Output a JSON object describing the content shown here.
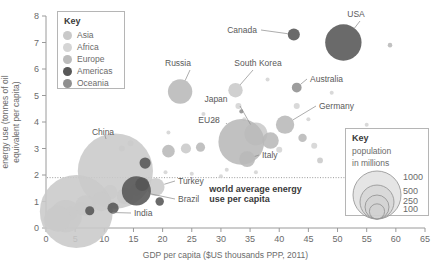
{
  "chart_data": {
    "type": "scatter",
    "title": "",
    "xlabel": "GDP per capita ($US thousands PPP, 2011)",
    "ylabel": "energy use (tonnes of oil equivalent per capita)",
    "xlim": [
      0,
      65
    ],
    "ylim": [
      0,
      8
    ],
    "xticks": [
      "0",
      "5",
      "10",
      "15",
      "20",
      "25",
      "30",
      "35",
      "40",
      "45",
      "50",
      "55",
      "60",
      "65"
    ],
    "yticks": [
      "0",
      "1",
      "2",
      "3",
      "4",
      "5",
      "6",
      "7",
      "8"
    ],
    "grid": false,
    "legend_position": "top-left",
    "bubble_size_meaning": "population in millions",
    "annotations": [
      {
        "name": "world-average-line",
        "text": "world average energy use per capita",
        "y_value": 1.9,
        "style": "dotted horizontal line across plot"
      }
    ],
    "series": [
      {
        "name": "Asia",
        "color": "#c9c9c9",
        "points": [
          {
            "label": "China",
            "x": 11.9,
            "y": 2.15,
            "population": 1360
          },
          {
            "label": "India",
            "x": 5.2,
            "y": 0.62,
            "population": 1280
          },
          {
            "label": "Japan",
            "x": 36.0,
            "y": 3.55,
            "population": 127
          },
          {
            "label": "South Korea",
            "x": 32.5,
            "y": 5.2,
            "population": 50
          },
          {
            "label": "Turkey",
            "x": 18.8,
            "y": 1.55,
            "population": 77
          },
          {
            "label": "",
            "x": 2.0,
            "y": 0.35,
            "population": 160
          },
          {
            "label": "",
            "x": 3.4,
            "y": 0.45,
            "population": 250
          },
          {
            "label": "",
            "x": 6.8,
            "y": 0.85,
            "population": 100
          },
          {
            "label": "",
            "x": 9.5,
            "y": 1.0,
            "population": 90
          },
          {
            "label": "",
            "x": 13.5,
            "y": 1.2,
            "population": 60
          },
          {
            "label": "",
            "x": 15.5,
            "y": 1.45,
            "population": 30
          },
          {
            "label": "",
            "x": 24.0,
            "y": 3.0,
            "population": 25
          },
          {
            "label": "",
            "x": 47.0,
            "y": 2.55,
            "population": 8
          }
        ]
      },
      {
        "name": "Africa",
        "color": "#d5d5d5",
        "points": [
          {
            "label": "",
            "x": 1.2,
            "y": 0.3,
            "population": 90
          },
          {
            "label": "",
            "x": 2.6,
            "y": 0.4,
            "population": 50
          },
          {
            "label": "",
            "x": 4.2,
            "y": 0.55,
            "population": 45
          },
          {
            "label": "",
            "x": 6.0,
            "y": 0.75,
            "population": 40
          },
          {
            "label": "",
            "x": 11.0,
            "y": 1.35,
            "population": 52
          }
        ]
      },
      {
        "name": "Europe",
        "color": "#b8b8b8",
        "points": [
          {
            "label": "EU28",
            "x": 33.5,
            "y": 3.25,
            "population": 505
          },
          {
            "label": "Germany",
            "x": 41.0,
            "y": 3.9,
            "population": 81
          },
          {
            "label": "Russia",
            "x": 23.0,
            "y": 5.15,
            "population": 143
          },
          {
            "label": "Italy",
            "x": 34.5,
            "y": 2.6,
            "population": 60
          },
          {
            "label": "",
            "x": 38.5,
            "y": 3.3,
            "population": 66
          },
          {
            "label": "",
            "x": 44.0,
            "y": 3.4,
            "population": 17
          },
          {
            "label": "",
            "x": 21.0,
            "y": 2.9,
            "population": 38
          },
          {
            "label": "",
            "x": 26.5,
            "y": 3.05,
            "population": 20
          },
          {
            "label": "",
            "x": 59.0,
            "y": 6.9,
            "population": 5
          }
        ]
      },
      {
        "name": "Americas",
        "color": "#555555",
        "points": [
          {
            "label": "USA",
            "x": 51.0,
            "y": 7.0,
            "population": 318
          },
          {
            "label": "Canada",
            "x": 42.5,
            "y": 7.3,
            "population": 35
          },
          {
            "label": "Brazil",
            "x": 15.5,
            "y": 1.4,
            "population": 203
          },
          {
            "label": "",
            "x": 17.0,
            "y": 2.45,
            "population": 30
          },
          {
            "label": "",
            "x": 16.5,
            "y": 1.65,
            "population": 45
          },
          {
            "label": "",
            "x": 19.5,
            "y": 1.0,
            "population": 17
          },
          {
            "label": "",
            "x": 11.5,
            "y": 0.75,
            "population": 30
          },
          {
            "label": "",
            "x": 7.5,
            "y": 0.65,
            "population": 20
          }
        ]
      },
      {
        "name": "Oceania",
        "color": "#8f8f8f",
        "points": [
          {
            "label": "Australia",
            "x": 43.0,
            "y": 5.3,
            "population": 23
          },
          {
            "label": "",
            "x": 33.5,
            "y": 4.4,
            "population": 4
          }
        ]
      }
    ]
  },
  "legend_continents": {
    "title": "Key",
    "items": [
      {
        "label": "Asia",
        "color": "#c9c9c9"
      },
      {
        "label": "Africa",
        "color": "#d5d5d5"
      },
      {
        "label": "Europe",
        "color": "#bcbcbc"
      },
      {
        "label": "Americas",
        "color": "#585858"
      },
      {
        "label": "Oceania",
        "color": "#8f8f8f"
      }
    ]
  },
  "legend_population": {
    "title": "Key",
    "subtitle_line1": "population",
    "subtitle_line2": "in millions",
    "sizes": [
      {
        "label": "1000",
        "value": 1000
      },
      {
        "label": "500",
        "value": 500
      },
      {
        "label": "250",
        "value": 250
      },
      {
        "label": "100",
        "value": 100
      }
    ]
  },
  "world_average": {
    "line1": "world average energy",
    "line2": "use per capita"
  }
}
